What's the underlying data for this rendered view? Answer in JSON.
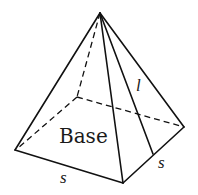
{
  "figure": {
    "labels": {
      "base": "Base",
      "slant_height": "l",
      "side_front": "s",
      "side_right": "s"
    },
    "colors": {
      "stroke": "#111111",
      "text": "#1a1a1a",
      "background": "#ffffff"
    }
  }
}
